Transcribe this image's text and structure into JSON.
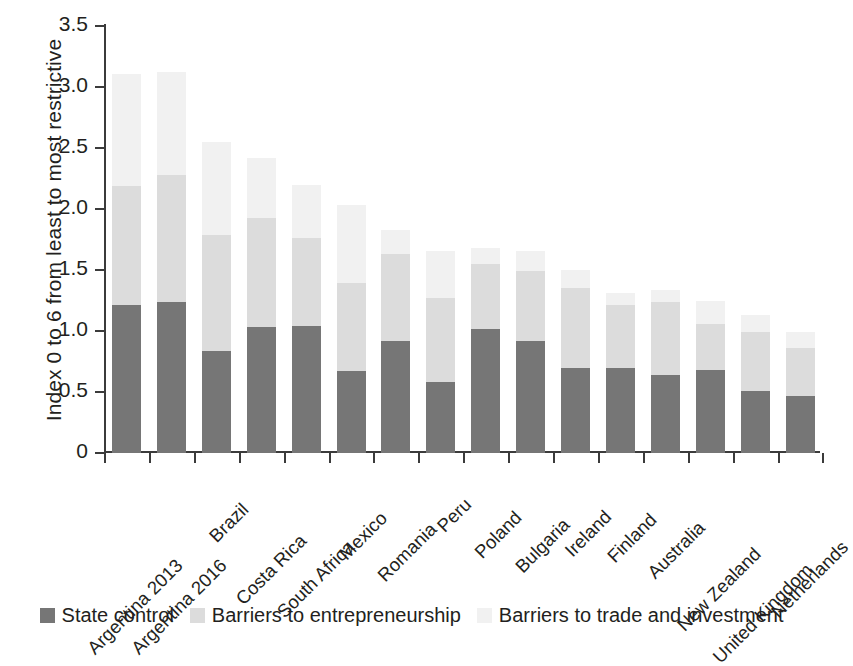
{
  "chart_data": {
    "type": "bar",
    "subtype": "stacked-vertical",
    "title": "",
    "xlabel": "",
    "ylabel": "Index 0 to 6 from least to most restrictive",
    "ylim": [
      0,
      3.5
    ],
    "ytick_labels": [
      "0",
      "0.5",
      "1.0",
      "1.5",
      "2.0",
      "2.5",
      "3.0",
      "3.5"
    ],
    "ytick_values": [
      0,
      0.5,
      1.0,
      1.5,
      2.0,
      2.5,
      3.0,
      3.5
    ],
    "grid": false,
    "legend_position": "bottom",
    "categories": [
      "Argentina 2013",
      "Argentina 2016",
      "Brazil",
      "Costa Rica",
      "South Africa",
      "Mexico",
      "Romania",
      "Peru",
      "Poland",
      "Bulgaria",
      "Ireland",
      "Finland",
      "Australia",
      "New Zealand",
      "United Kingdom",
      "Netherlands"
    ],
    "series": [
      {
        "name": "State control",
        "color": "#767676",
        "values": [
          1.21,
          1.24,
          0.84,
          1.03,
          1.04,
          0.67,
          0.92,
          0.58,
          1.02,
          0.92,
          0.7,
          0.7,
          0.64,
          0.68,
          0.51,
          0.47
        ]
      },
      {
        "name": "Barriers to entrepreneurship",
        "color": "#dcdcdc",
        "values": [
          0.98,
          1.04,
          0.95,
          0.9,
          0.72,
          0.72,
          0.71,
          0.69,
          0.53,
          0.57,
          0.65,
          0.51,
          0.6,
          0.38,
          0.48,
          0.39
        ]
      },
      {
        "name": "Barriers to trade and investment",
        "color": "#f1f1f1",
        "values": [
          0.92,
          0.84,
          0.76,
          0.49,
          0.44,
          0.64,
          0.2,
          0.39,
          0.13,
          0.17,
          0.15,
          0.1,
          0.1,
          0.19,
          0.14,
          0.13
        ]
      }
    ],
    "totals": [
      3.11,
      3.12,
      2.55,
      2.42,
      2.2,
      2.03,
      1.83,
      1.66,
      1.68,
      1.66,
      1.5,
      1.31,
      1.34,
      1.25,
      1.13,
      0.99
    ]
  },
  "legend": {
    "items": [
      {
        "label": "State control",
        "color": "#767676"
      },
      {
        "label": "Barriers to entrepreneurship",
        "color": "#dcdcdc"
      },
      {
        "label": "Barriers to trade and investment",
        "color": "#f1f1f1"
      }
    ]
  }
}
